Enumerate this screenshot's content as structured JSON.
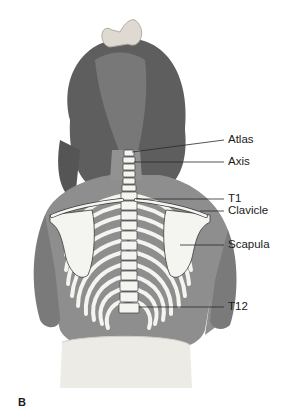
{
  "figure": {
    "panel_letter": "B",
    "labels": [
      {
        "text": "Atlas",
        "y": 140
      },
      {
        "text": "Axis",
        "y": 162
      },
      {
        "text": "T1",
        "y": 199
      },
      {
        "text": "Clavicle",
        "y": 211
      },
      {
        "text": "Scapula",
        "y": 245
      },
      {
        "text": "T12",
        "y": 307
      }
    ],
    "colors": {
      "skin": "#8c8c8c",
      "hair": "#5a5a5a",
      "bone": "#f4f4f0",
      "bone_outline": "#3a3a3a",
      "leader_line": "#2a2a2a",
      "diaper": "#ebebe6",
      "bow": "#dcdcd4"
    }
  }
}
